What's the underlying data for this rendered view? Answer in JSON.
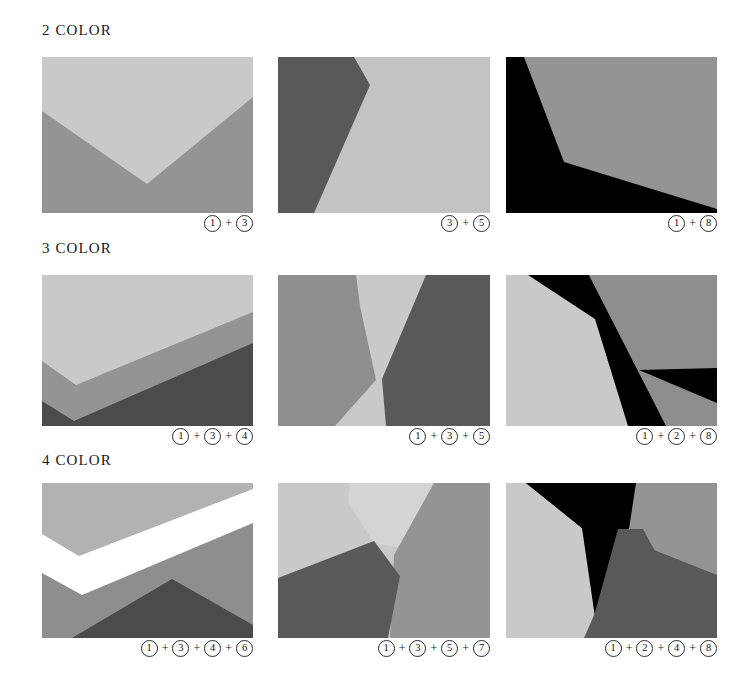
{
  "page": {
    "background": "#ffffff",
    "width": 754,
    "height": 691
  },
  "palette": {
    "white": "#ffffff",
    "very_light_gray": "#d4d4d2",
    "light_gray": "#c9c9c7",
    "light_gray_2": "#c3c3c1",
    "mid_light_gray": "#b2b2b0",
    "mid_gray": "#949492",
    "mid_gray_2": "#8e8e8c",
    "dark_gray": "#636361",
    "darker_gray": "#59595a",
    "charcoal": "#4b4b4c",
    "black": "#000000"
  },
  "rows": [
    {
      "id": "row-2-color",
      "heading": "2 COLOR",
      "panels": [
        {
          "id": "panel-2color-1",
          "caption_numbers": [
            "1",
            "3"
          ],
          "caption_text": "1 + 3",
          "colors": [
            "#c9c9c7",
            "#949492"
          ],
          "shape": "chevron-v-light-over-mid"
        },
        {
          "id": "panel-2color-2",
          "caption_numbers": [
            "3",
            "5"
          ],
          "caption_text": "3 + 5",
          "colors": [
            "#59595a",
            "#c3c3c1"
          ],
          "shape": "left-dark-wedge-right-light"
        },
        {
          "id": "panel-2color-3",
          "caption_numbers": [
            "1",
            "8"
          ],
          "caption_text": "1 + 8",
          "colors": [
            "#000000",
            "#949492"
          ],
          "shape": "left-black-wedge-right-mid"
        }
      ]
    },
    {
      "id": "row-3-color",
      "heading": "3 COLOR",
      "panels": [
        {
          "id": "panel-3color-1",
          "caption_numbers": [
            "1",
            "3",
            "4"
          ],
          "caption_text": "1 + 3 + 4",
          "colors": [
            "#c9c9c7",
            "#949492",
            "#4b4b4c"
          ],
          "shape": "stacked-chevron-bands"
        },
        {
          "id": "panel-3color-2",
          "caption_numbers": [
            "1",
            "3",
            "5"
          ],
          "caption_text": "1 + 3 + 5",
          "colors": [
            "#8e8e8c",
            "#c9c9c7",
            "#59595a"
          ],
          "shape": "vertical-hourglass-band"
        },
        {
          "id": "panel-3color-3",
          "caption_numbers": [
            "1",
            "2",
            "8"
          ],
          "caption_text": "1 + 2 + 8",
          "colors": [
            "#c9c9c7",
            "#000000",
            "#8e8e8c"
          ],
          "shape": "black-diagonal-between-light-and-mid"
        }
      ]
    },
    {
      "id": "row-4-color",
      "heading": "4 COLOR",
      "panels": [
        {
          "id": "panel-4color-1",
          "caption_numbers": [
            "1",
            "3",
            "4",
            "6"
          ],
          "caption_text": "1 + 3 + 4 + 6",
          "colors": [
            "#b2b2b0",
            "#ffffff",
            "#8e8e8c",
            "#4b4b4c"
          ],
          "shape": "white-chevron-band-with-dark-mountain"
        },
        {
          "id": "panel-4color-2",
          "caption_numbers": [
            "1",
            "3",
            "5",
            "7"
          ],
          "caption_text": "1 + 3 + 5 + 7",
          "colors": [
            "#c9c9c7",
            "#d4d4d2",
            "#949492",
            "#59595a"
          ],
          "shape": "four-region-angular-split"
        },
        {
          "id": "panel-4color-3",
          "caption_numbers": [
            "1",
            "2",
            "4",
            "8"
          ],
          "caption_text": "1 + 2 + 4 + 8",
          "colors": [
            "#c9c9c7",
            "#000000",
            "#949492",
            "#59595a"
          ],
          "shape": "black-wedge-over-dark-and-mid"
        }
      ]
    }
  ],
  "separator": "+"
}
